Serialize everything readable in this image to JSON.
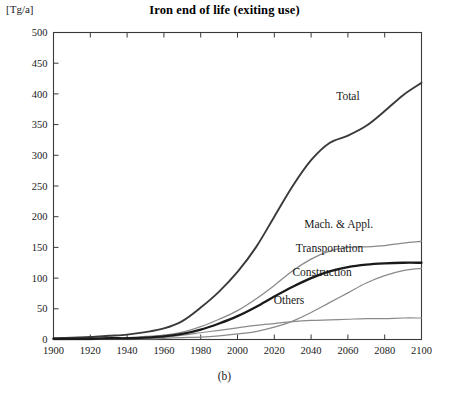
{
  "chart_data": {
    "type": "line",
    "title": "Iron end of life (exiting use)",
    "caption": "(b)",
    "unit_label": "[Tg/a]",
    "xlabel": "",
    "ylabel": "",
    "xlim": [
      1900,
      2100
    ],
    "ylim": [
      0,
      500
    ],
    "grid": false,
    "legend_position": "inline-annotations",
    "xticks": [
      1900,
      1920,
      1940,
      1960,
      1980,
      2000,
      2020,
      2040,
      2060,
      2080,
      2100
    ],
    "yticks": [
      0,
      50,
      100,
      150,
      200,
      250,
      300,
      350,
      400,
      450,
      500
    ],
    "x": [
      1900,
      1910,
      1920,
      1930,
      1940,
      1950,
      1960,
      1970,
      1980,
      1990,
      2000,
      2010,
      2020,
      2030,
      2040,
      2050,
      2060,
      2070,
      2080,
      2090,
      2100
    ],
    "series": [
      {
        "name": "Total",
        "color": "#3a3a3a",
        "width": 1.9,
        "label_x": 2060,
        "label_y": 390,
        "values": [
          2,
          3,
          4,
          6,
          8,
          12,
          18,
          30,
          52,
          78,
          110,
          150,
          200,
          250,
          292,
          320,
          332,
          348,
          372,
          398,
          418
        ]
      },
      {
        "name": "Mach. & Appl.",
        "color": "#8a8a8a",
        "width": 1.3,
        "label_x": 2055,
        "label_y": 182,
        "values": [
          1,
          1,
          2,
          2,
          3,
          5,
          7,
          12,
          21,
          33,
          47,
          66,
          88,
          112,
          131,
          144,
          150,
          151,
          153,
          157,
          160
        ]
      },
      {
        "name": "Transportation",
        "color": "#8a8a8a",
        "width": 1.3,
        "label_x": 2050,
        "label_y": 143,
        "values": [
          0,
          0,
          0,
          1,
          1,
          1,
          2,
          3,
          4,
          6,
          9,
          13,
          20,
          30,
          44,
          60,
          76,
          92,
          104,
          112,
          116
        ]
      },
      {
        "name": "Construction",
        "color": "#1a1a1a",
        "width": 2.3,
        "label_x": 2046,
        "label_y": 104,
        "values": [
          1,
          1,
          1,
          2,
          2,
          3,
          5,
          9,
          16,
          26,
          38,
          53,
          70,
          86,
          100,
          111,
          118,
          122,
          124,
          125,
          125
        ]
      },
      {
        "name": "Others",
        "color": "#8a8a8a",
        "width": 1.2,
        "label_x": 2028,
        "label_y": 58,
        "values": [
          1,
          1,
          1,
          2,
          2,
          3,
          4,
          7,
          11,
          15,
          19,
          23,
          26,
          29,
          31,
          32,
          33,
          34,
          34,
          35,
          35
        ]
      }
    ]
  }
}
